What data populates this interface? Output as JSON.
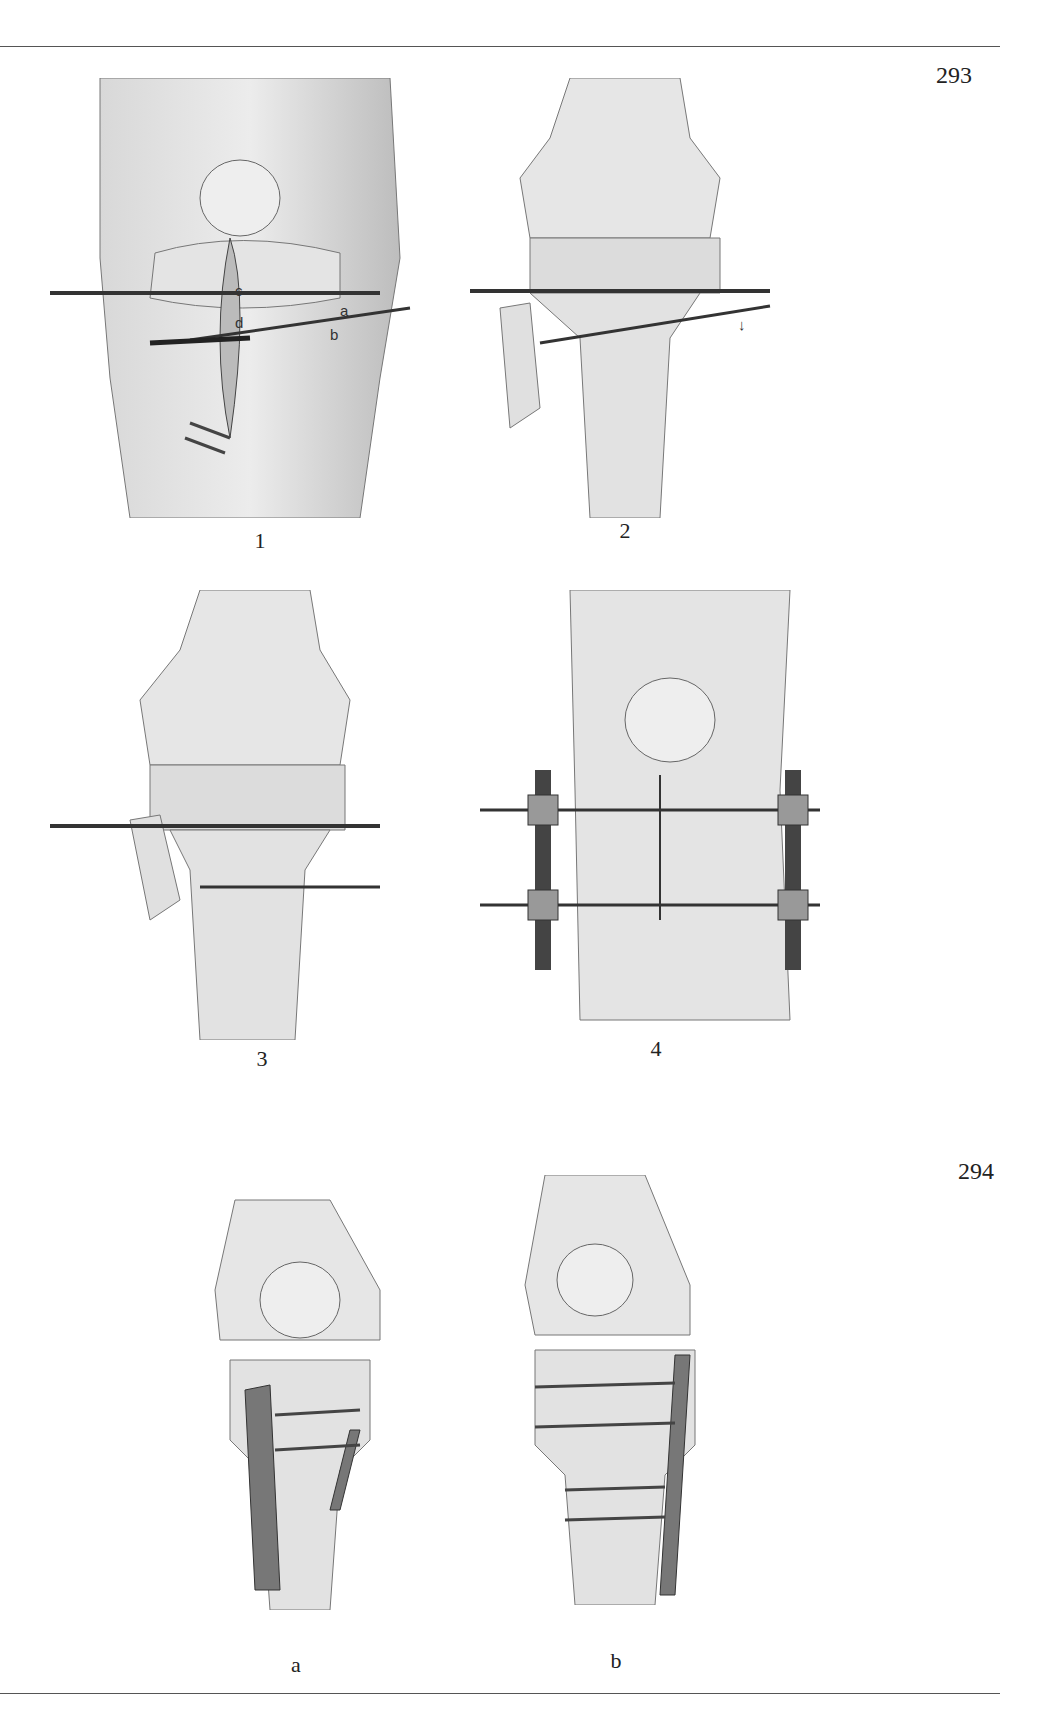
{
  "page": {
    "top_rule": true,
    "bottom_rule": true
  },
  "figures": [
    {
      "number": "293",
      "panels": [
        {
          "label": "1",
          "annotations": [
            "a",
            "b",
            "c",
            "d"
          ],
          "description": "knee with incision, two transfixing pins a and b, screws c and d"
        },
        {
          "label": "2",
          "annotations": [
            "↓"
          ],
          "description": "tibial plateau osteotomy with pins and screws, downward arrow"
        },
        {
          "label": "3",
          "annotations": [],
          "description": "tibial plateau reduced with pins and screw"
        },
        {
          "label": "4",
          "annotations": [],
          "description": "external fixator with threaded bars and sutured incision"
        }
      ]
    },
    {
      "number": "294",
      "panels": [
        {
          "label": "a",
          "annotations": [],
          "description": "tibial plateau fixed with two buttress plates and screws"
        },
        {
          "label": "b",
          "annotations": [],
          "description": "tibial plateau fixed with lateral buttress plate and lag screws"
        }
      ]
    }
  ]
}
